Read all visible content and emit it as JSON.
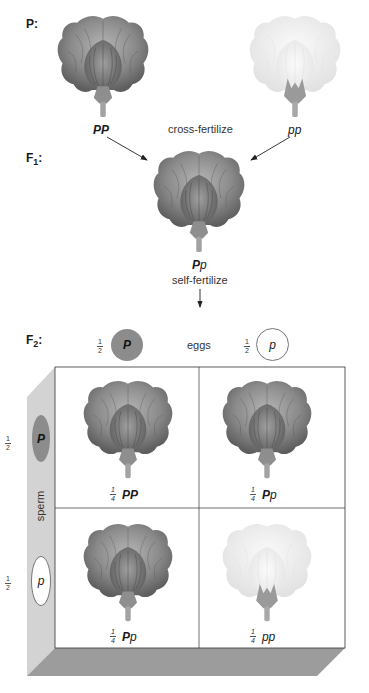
{
  "parental": {
    "label": "P:",
    "left": {
      "genotype_bold": "PP",
      "genotype_rest": "",
      "phenotype": "purple"
    },
    "right": {
      "genotype_bold": "",
      "genotype_rest": "pp",
      "phenotype": "white"
    },
    "action": "cross-fertilize"
  },
  "f1": {
    "label_main": "F",
    "label_sub": "1",
    "label_tail": ":",
    "offspring": {
      "genotype_bold": "P",
      "genotype_rest": "p",
      "phenotype": "purple"
    },
    "action": "self-fertilize"
  },
  "f2": {
    "label_main": "F",
    "label_sub": "2",
    "label_tail": ":",
    "eggs_label": "eggs",
    "sperm_label": "sperm",
    "eggs": [
      {
        "frac_num": "1",
        "frac_den": "2",
        "allele": "P",
        "dominant": true
      },
      {
        "frac_num": "1",
        "frac_den": "2",
        "allele": "p",
        "dominant": false
      }
    ],
    "sperm": [
      {
        "frac_num": "1",
        "frac_den": "2",
        "allele": "P",
        "dominant": true
      },
      {
        "frac_num": "1",
        "frac_den": "2",
        "allele": "p",
        "dominant": false
      }
    ],
    "cells": [
      {
        "frac_num": "1",
        "frac_den": "4",
        "genotype_bold": "PP",
        "genotype_rest": "",
        "phenotype": "purple"
      },
      {
        "frac_num": "1",
        "frac_den": "4",
        "genotype_bold": "P",
        "genotype_rest": "p",
        "phenotype": "purple"
      },
      {
        "frac_num": "1",
        "frac_den": "4",
        "genotype_bold": "P",
        "genotype_rest": "p",
        "phenotype": "purple"
      },
      {
        "frac_num": "1",
        "frac_den": "4",
        "genotype_bold": "",
        "genotype_rest": "pp",
        "phenotype": "white"
      }
    ]
  },
  "colors": {
    "purple_petal": "#7d7d7d",
    "white_petal": "#ececec",
    "dominant_gamete": "#8c8c8c",
    "panel_side": "#d0d0d0",
    "panel_shadow": "#9a9a9a"
  }
}
